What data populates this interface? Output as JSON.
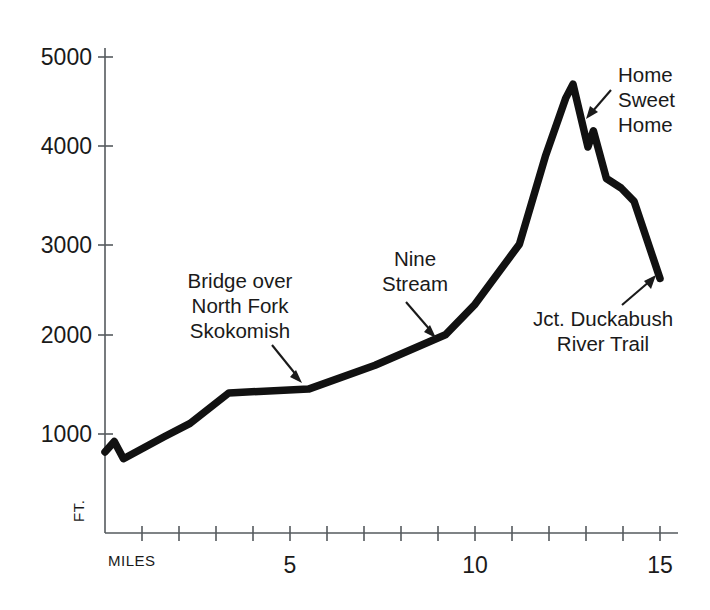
{
  "chart_data": {
    "type": "line",
    "title": "",
    "xlabel": "MILES",
    "ylabel": "FT.",
    "xlim": [
      0,
      15.2
    ],
    "ylim": [
      0,
      5000
    ],
    "grid": false,
    "legend": "none",
    "x_ticks_every": 1,
    "x_tick_labels": [
      {
        "value": 5,
        "label": "5"
      },
      {
        "value": 10,
        "label": "10"
      },
      {
        "value": 15,
        "label": "15"
      }
    ],
    "y_tick_labels": [
      {
        "value": 1000,
        "label": "1000"
      },
      {
        "value": 2000,
        "label": "2000"
      },
      {
        "value": 3000,
        "label": "3000"
      },
      {
        "value": 4000,
        "label": "4000"
      },
      {
        "value": 5000,
        "label": "5000"
      }
    ],
    "series": [
      {
        "name": "Trail elevation profile",
        "color": "#111111",
        "points": [
          {
            "x": 0.0,
            "y": 850
          },
          {
            "x": 0.25,
            "y": 960
          },
          {
            "x": 0.5,
            "y": 780
          },
          {
            "x": 1.6,
            "y": 1010
          },
          {
            "x": 2.3,
            "y": 1150
          },
          {
            "x": 3.35,
            "y": 1470
          },
          {
            "x": 5.5,
            "y": 1510
          },
          {
            "x": 7.3,
            "y": 1760
          },
          {
            "x": 9.2,
            "y": 2080
          },
          {
            "x": 10.0,
            "y": 2400
          },
          {
            "x": 11.2,
            "y": 3030
          },
          {
            "x": 11.9,
            "y": 3950
          },
          {
            "x": 12.45,
            "y": 4560
          },
          {
            "x": 12.65,
            "y": 4710
          },
          {
            "x": 13.05,
            "y": 4050
          },
          {
            "x": 13.2,
            "y": 4220
          },
          {
            "x": 13.55,
            "y": 3720
          },
          {
            "x": 13.95,
            "y": 3620
          },
          {
            "x": 14.3,
            "y": 3480
          },
          {
            "x": 15.0,
            "y": 2670
          }
        ]
      }
    ],
    "annotations": [
      {
        "id": "bridge",
        "lines": [
          "Bridge over",
          "North Fork",
          "Skokomish"
        ],
        "align": "center",
        "target_x": 4.6,
        "target_y": 1490,
        "arrow": "down-right"
      },
      {
        "id": "nine-stream",
        "lines": [
          "Nine",
          "Stream"
        ],
        "align": "center",
        "target_x": 9.1,
        "target_y": 2080,
        "arrow": "down-right"
      },
      {
        "id": "home-sweet-home",
        "lines": [
          "Home",
          "Sweet",
          "Home"
        ],
        "align": "left",
        "target_x": 13.2,
        "target_y": 4220,
        "arrow": "down-left"
      },
      {
        "id": "duckabush",
        "lines": [
          "Jct. Duckabush",
          "River Trail"
        ],
        "align": "center",
        "target_x": 14.85,
        "target_y": 2790,
        "arrow": "up-right"
      }
    ]
  },
  "axis": {
    "x_unit_label": "MILES",
    "y_unit_label": "FT."
  },
  "labels": {
    "y1000": "1000",
    "y2000": "2000",
    "y3000": "3000",
    "y4000": "4000",
    "y5000": "5000",
    "x5": "5",
    "x10": "10",
    "x15": "15",
    "bridge_l1": "Bridge over",
    "bridge_l2": "North Fork",
    "bridge_l3": "Skokomish",
    "nine_l1": "Nine",
    "nine_l2": "Stream",
    "home_l1": "Home",
    "home_l2": "Sweet",
    "home_l3": "Home",
    "duck_l1": "Jct. Duckabush",
    "duck_l2": "River Trail"
  }
}
